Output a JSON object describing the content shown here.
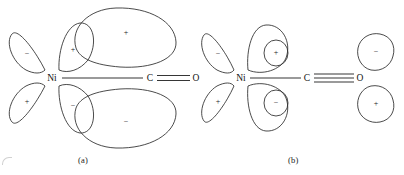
{
  "figure": {
    "type": "orbital-overlap-diagram",
    "stroke_color": "#2b2b2b",
    "background": "#ffffff",
    "panels": [
      {
        "id": "a",
        "caption": "(a)",
        "atoms": [
          {
            "label": "Ni",
            "x": 52,
            "y": 78
          },
          {
            "label": "C",
            "x": 150,
            "y": 78
          },
          {
            "label": "O",
            "x": 196,
            "y": 78
          }
        ],
        "bonds": [
          {
            "from": "Ni",
            "to": "C",
            "order": 1
          },
          {
            "from": "C",
            "to": "O",
            "order": 2
          }
        ],
        "lobes": [
          {
            "name": "ni-upper-left-lobe",
            "sign": "−"
          },
          {
            "name": "ni-upper-inner-lobe",
            "sign": "+"
          },
          {
            "name": "ni-lower-left-lobe",
            "sign": "+"
          },
          {
            "name": "ni-lower-inner-lobe",
            "sign": "−"
          },
          {
            "name": "co-upper-pi-lobe",
            "sign": "+"
          },
          {
            "name": "co-lower-pi-lobe",
            "sign": "−"
          }
        ]
      },
      {
        "id": "b",
        "caption": "(b)",
        "atoms": [
          {
            "label": "Ni",
            "x": 241,
            "y": 78
          },
          {
            "label": "C",
            "x": 307,
            "y": 78
          },
          {
            "label": "O",
            "x": 360,
            "y": 78
          }
        ],
        "bonds": [
          {
            "from": "Ni",
            "to": "C",
            "order": 1
          },
          {
            "from": "C",
            "to": "O",
            "order": 3
          }
        ],
        "lobes": [
          {
            "name": "ni-upper-left-lobe",
            "sign": "−"
          },
          {
            "name": "ni-upper-inner-lobe",
            "sign": "+"
          },
          {
            "name": "ni-lower-left-lobe",
            "sign": "+"
          },
          {
            "name": "ni-lower-inner-lobe",
            "sign": "−"
          },
          {
            "name": "o-upper-lobe",
            "sign": "−"
          },
          {
            "name": "o-lower-lobe",
            "sign": "+"
          }
        ]
      }
    ]
  }
}
